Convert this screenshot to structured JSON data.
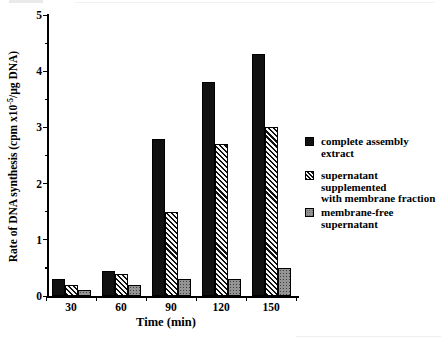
{
  "figure": {
    "background": "#ffffff",
    "ylabel_prefix": "Rate of DNA synthesis (cpm x10",
    "ylabel_sup": "-5",
    "ylabel_suffix": "/µg DNA)",
    "colors": {
      "series_solid": "#111111",
      "series_hatch_fg": "#101010",
      "series_hatch_bg": "#f7f7f7",
      "series_gray": "#949494",
      "axis": "#000000",
      "text": "#000000"
    }
  },
  "legend": {
    "items": [
      {
        "name": "complete assembly extract",
        "line1": "complete assembly",
        "line2": "extract",
        "swatch": "solid-black"
      },
      {
        "name": "supernatant supplemented with membrane fraction",
        "line1": "supernatant supplemented",
        "line2": "with membrane fraction",
        "swatch": "diagonal-hatch"
      },
      {
        "name": "membrane-free supernatant",
        "line1": "membrane-free",
        "line2": "supernatant",
        "swatch": "gray-stipple"
      }
    ]
  },
  "chart_data": {
    "type": "bar",
    "title": "",
    "categories": [
      "30",
      "60",
      "90",
      "120",
      "150"
    ],
    "series": [
      {
        "name": "complete assembly extract",
        "pattern": "solid-black",
        "values": [
          0.3,
          0.45,
          2.8,
          3.8,
          4.3
        ]
      },
      {
        "name": "supernatant supplemented with membrane fraction",
        "pattern": "diagonal-hatch",
        "values": [
          0.2,
          0.4,
          1.5,
          2.7,
          3.0
        ]
      },
      {
        "name": "membrane-free supernatant",
        "pattern": "gray-stipple",
        "values": [
          0.1,
          0.2,
          0.3,
          0.3,
          0.5
        ]
      }
    ],
    "xlabel": "Time (min)",
    "ylabel": "Rate of DNA synthesis (cpm x10^-5/µg DNA)",
    "ylim": [
      0,
      5
    ],
    "yticks": [
      0,
      1,
      2,
      3,
      4,
      5
    ],
    "minor_tick_interval": 0.5,
    "grid": false,
    "legend_position": "right"
  }
}
